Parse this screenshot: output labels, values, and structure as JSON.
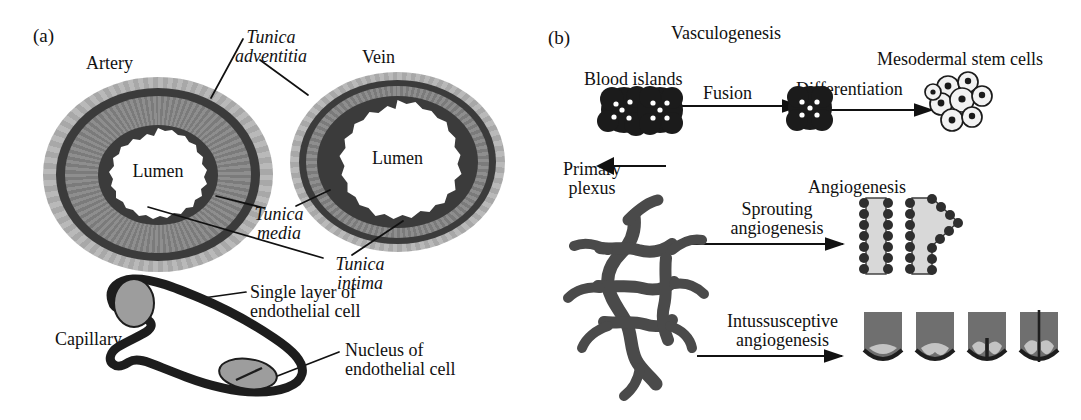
{
  "figure": {
    "background_color": "#ffffff",
    "ink_color": "#111111"
  },
  "panel_a": {
    "tag": "(a)",
    "artery": {
      "title": "Artery",
      "lumen_label": "Lumen"
    },
    "vein": {
      "title": "Vein",
      "lumen_label": "Lumen"
    },
    "labels": {
      "tunica_adventitia_line1": "Tunica",
      "tunica_adventitia_line2": "adventitia",
      "tunica_media_line1": "Tunica",
      "tunica_media_line2": "media",
      "tunica_intima_line1": "Tunica",
      "tunica_intima_line2": "intima",
      "single_layer_line1": "Single layer of",
      "single_layer_line2": "endothelial cell",
      "nucleus_line1": "Nucleus of",
      "nucleus_line2": "endothelial cell",
      "capillary": "Capillary"
    },
    "colors": {
      "adventitia": "#b0b0b0",
      "dark_band": "#3b3b3b",
      "media": "#858585",
      "lumen": "#ffffff",
      "nucleus": "#9d9d9d",
      "capillary_wall": "#1d1d1d"
    }
  },
  "panel_b": {
    "tag": "(b)",
    "process_titles": {
      "vasculogenesis": "Vasculogenesis",
      "angiogenesis": "Angiogenesis"
    },
    "labels": {
      "mesodermal_stem_cells": "Mesodermal stem cells",
      "blood_islands": "Blood islands",
      "primary_plexus_line1": "Primary",
      "primary_plexus_line2": "plexus",
      "sprouting_line1": "Sprouting",
      "sprouting_line2": "angiogenesis",
      "intussusceptive_line1": "Intussusceptive",
      "intussusceptive_line2": "angiogenesis"
    },
    "arrows": [
      {
        "name": "differentiation",
        "label": "Differentiation",
        "direction": "left"
      },
      {
        "name": "fusion",
        "label": "Fusion",
        "direction": "left"
      },
      {
        "name": "primary-plexus",
        "label": "",
        "direction": "down"
      },
      {
        "name": "sprouting",
        "label": "",
        "direction": "right"
      },
      {
        "name": "intussusceptive",
        "label": "",
        "direction": "right"
      }
    ],
    "colors": {
      "blood_island": "#1b1b1b",
      "stem_cell_fill": "#f2f2f2",
      "stem_cell_nucleus": "#1b1b1b",
      "plexus": "#4a4a4a",
      "vessel_dark": "#3a3a3a",
      "vessel_lumen": "#d8d8d8",
      "tube_body": "#6f6f6f"
    },
    "intussusception_stages": 4,
    "sprouting_shapes": 2
  }
}
